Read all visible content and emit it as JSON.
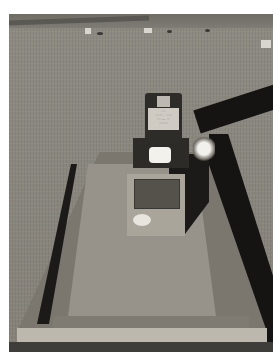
{
  "image": {
    "description": "Cemetery grave plot with dark headstone, concrete slab and surrounding curb on dry grass; long shadows fall across the right side",
    "colors": {
      "background": "#ffffff",
      "grass": "#8a877f",
      "slab": "#97938a",
      "headstone": "#2e2c29",
      "shadow": "#151412",
      "curb": "#bdb8ae"
    }
  },
  "headstone": {
    "inscription_lines": [
      "·····",
      "········  ·  ······",
      "····  —  ····",
      "··········"
    ]
  }
}
